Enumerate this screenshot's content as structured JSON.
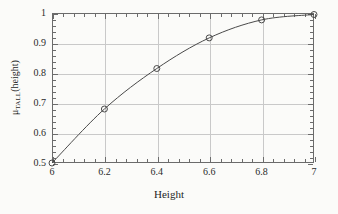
{
  "chart_data": {
    "type": "line",
    "title": "",
    "xlabel": "Height",
    "ylabel_text": "μTALL(height)",
    "ylabel_mu": "μ",
    "ylabel_sub": "TALL",
    "ylabel_arg": "(height)",
    "x": [
      6,
      6.2,
      6.4,
      6.6,
      6.8,
      7
    ],
    "values": [
      0.5,
      0.68,
      0.815,
      0.917,
      0.977,
      0.995
    ],
    "series": [
      {
        "name": "μTALL(height)",
        "x": [
          6,
          6.2,
          6.4,
          6.6,
          6.8,
          7
        ],
        "values": [
          0.5,
          0.68,
          0.815,
          0.917,
          0.977,
          0.995
        ]
      }
    ],
    "xlim": [
      6,
      7
    ],
    "ylim": [
      0.5,
      1
    ],
    "xticks": [
      6,
      6.2,
      6.4,
      6.6,
      6.8,
      7
    ],
    "xticklabels": [
      "6",
      "6.2",
      "6.4",
      "6.6",
      "6.8",
      "7"
    ],
    "yticks": [
      0.5,
      0.6,
      0.7,
      0.8,
      0.9,
      1
    ],
    "yticklabels": [
      "0.5",
      "0.6",
      "0.7",
      "0.8",
      "0.9",
      "1"
    ],
    "x_minor_per_major": 5,
    "y_minor_per_major": 5,
    "grid": true,
    "grid_color": "#c9c9c9",
    "legend": false,
    "marker": "open-circle",
    "line_color": "#4a4a4a",
    "marker_color": "#4a4a4a",
    "frame_color": "#6b6b6b",
    "background": "#fbfbf9"
  }
}
